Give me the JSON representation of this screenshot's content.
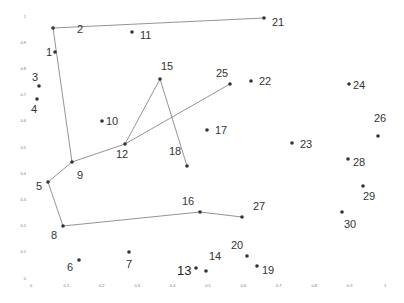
{
  "chart_data": {
    "type": "scatter",
    "title": "",
    "xlabel": "",
    "ylabel": "",
    "xlim": [
      0,
      1
    ],
    "ylim": [
      0,
      1
    ],
    "grid": false,
    "x_ticks": [
      "0",
      "0.1",
      "0.2",
      "0.3",
      "0.4",
      "0.5",
      "0.6",
      "0.7",
      "0.8",
      "0.9",
      "1"
    ],
    "y_ticks": [
      "0",
      "0.1",
      "0.2",
      "0.3",
      "0.4",
      "0.5",
      "0.6",
      "0.7",
      "0.8",
      "0.9",
      "1"
    ],
    "points": [
      {
        "id": "1",
        "x": 0.07,
        "y": 0.88
      },
      {
        "id": "2",
        "x": 0.06,
        "y": 0.97
      },
      {
        "id": "3",
        "x": 0.02,
        "y": 0.74
      },
      {
        "id": "4",
        "x": 0.02,
        "y": 0.69
      },
      {
        "id": "5",
        "x": 0.05,
        "y": 0.37
      },
      {
        "id": "6",
        "x": 0.14,
        "y": 0.07
      },
      {
        "id": "7",
        "x": 0.28,
        "y": 0.11
      },
      {
        "id": "8",
        "x": 0.09,
        "y": 0.21
      },
      {
        "id": "9",
        "x": 0.12,
        "y": 0.45
      },
      {
        "id": "10",
        "x": 0.2,
        "y": 0.61
      },
      {
        "id": "11",
        "x": 0.29,
        "y": 0.96
      },
      {
        "id": "12",
        "x": 0.27,
        "y": 0.52
      },
      {
        "id": "13",
        "x": 0.47,
        "y": 0.04
      },
      {
        "id": "14",
        "x": 0.5,
        "y": 0.03
      },
      {
        "id": "15",
        "x": 0.36,
        "y": 0.78
      },
      {
        "id": "16",
        "x": 0.48,
        "y": 0.26
      },
      {
        "id": "17",
        "x": 0.5,
        "y": 0.58
      },
      {
        "id": "18",
        "x": 0.44,
        "y": 0.44
      },
      {
        "id": "19",
        "x": 0.64,
        "y": 0.05
      },
      {
        "id": "20",
        "x": 0.61,
        "y": 0.09
      },
      {
        "id": "21",
        "x": 0.66,
        "y": 1.02
      },
      {
        "id": "22",
        "x": 0.62,
        "y": 0.77
      },
      {
        "id": "23",
        "x": 0.74,
        "y": 0.53
      },
      {
        "id": "24",
        "x": 0.9,
        "y": 0.76
      },
      {
        "id": "25",
        "x": 0.56,
        "y": 0.76
      },
      {
        "id": "26",
        "x": 0.98,
        "y": 0.56
      },
      {
        "id": "27",
        "x": 0.6,
        "y": 0.24
      },
      {
        "id": "28",
        "x": 0.9,
        "y": 0.47
      },
      {
        "id": "29",
        "x": 0.94,
        "y": 0.37
      },
      {
        "id": "30",
        "x": 0.88,
        "y": 0.27
      }
    ],
    "edges": [
      [
        "2",
        "21"
      ],
      [
        "2",
        "9"
      ],
      [
        "9",
        "5"
      ],
      [
        "5",
        "8"
      ],
      [
        "8",
        "16"
      ],
      [
        "16",
        "27"
      ],
      [
        "9",
        "12"
      ],
      [
        "12",
        "25"
      ],
      [
        "12",
        "15"
      ],
      [
        "15",
        "18"
      ]
    ]
  },
  "layout": {
    "plot_px": {
      "x0": 31,
      "x1": 385,
      "y0": 278,
      "y1": 16
    },
    "point_px": {
      "1": [
        55,
        52
      ],
      "2": [
        53,
        28
      ],
      "3": [
        39,
        86
      ],
      "4": [
        37,
        99
      ],
      "5": [
        48,
        182
      ],
      "6": [
        79,
        260
      ],
      "7": [
        129,
        252
      ],
      "8": [
        63,
        226
      ],
      "9": [
        72,
        162
      ],
      "10": [
        102,
        121
      ],
      "11": [
        132,
        32
      ],
      "12": [
        125,
        144
      ],
      "13": [
        196,
        268
      ],
      "14": [
        206,
        271
      ],
      "15": [
        160,
        79
      ],
      "16": [
        200,
        212
      ],
      "17": [
        207,
        130
      ],
      "18": [
        187,
        166
      ],
      "19": [
        257,
        266
      ],
      "20": [
        247,
        256
      ],
      "21": [
        264,
        18
      ],
      "22": [
        251,
        81
      ],
      "23": [
        292,
        143
      ],
      "24": [
        349,
        84
      ],
      "25": [
        230,
        84
      ],
      "26": [
        378,
        136
      ],
      "27": [
        242,
        217
      ],
      "28": [
        348,
        159
      ],
      "29": [
        363,
        186
      ],
      "30": [
        342,
        212
      ]
    },
    "label_px": {
      "1": [
        46,
        56
      ],
      "2": [
        77,
        33
      ],
      "3": [
        32,
        81
      ],
      "4": [
        31,
        113
      ],
      "5": [
        36,
        190
      ],
      "6": [
        67,
        271
      ],
      "7": [
        126,
        268
      ],
      "8": [
        51,
        239
      ],
      "9": [
        77,
        179
      ],
      "10": [
        106,
        125
      ],
      "11": [
        140,
        39
      ],
      "12": [
        116,
        158
      ],
      "13": [
        177,
        275
      ],
      "14": [
        209,
        260
      ],
      "15": [
        161,
        70
      ],
      "16": [
        182,
        205
      ],
      "17": [
        215,
        134
      ],
      "18": [
        169,
        155
      ],
      "19": [
        262,
        274
      ],
      "20": [
        231,
        249
      ],
      "21": [
        272,
        26
      ],
      "22": [
        259,
        85
      ],
      "23": [
        300,
        148
      ],
      "24": [
        353,
        89
      ],
      "25": [
        216,
        77
      ],
      "26": [
        374,
        122
      ],
      "27": [
        253,
        210
      ],
      "28": [
        353,
        166
      ],
      "29": [
        363,
        200
      ],
      "30": [
        344,
        228
      ]
    },
    "big_label": "13"
  }
}
